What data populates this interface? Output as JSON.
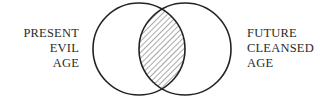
{
  "diagram": {
    "type": "venn",
    "left_set": {
      "lines": [
        "PRESENT",
        "EVIL",
        "AGE"
      ]
    },
    "right_set": {
      "lines": [
        "FUTURE",
        "CLEANSED",
        "AGE"
      ]
    },
    "intersection": {
      "style": "hatched"
    },
    "colors": {
      "stroke": "#222222",
      "hatch": "#444444",
      "background": "#ffffff"
    }
  }
}
